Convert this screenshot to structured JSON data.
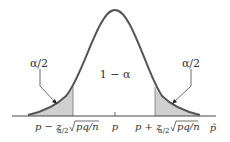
{
  "diagram": {
    "type": "normal-distribution-confidence-interval",
    "colors": {
      "curve": "#555555",
      "shade": "#d0d0d0",
      "axis": "#444444",
      "text": "#333333",
      "background": "#ffffff"
    },
    "labels": {
      "left_tail": "α/2",
      "right_tail": "α/2",
      "center_area": "1 − α",
      "lower_bound_prefix": "p − z",
      "upper_bound_prefix": "p + z",
      "subscript": "α/2",
      "radicand": "pq/n",
      "center_tick": "p",
      "axis_variable": "p̂"
    }
  }
}
